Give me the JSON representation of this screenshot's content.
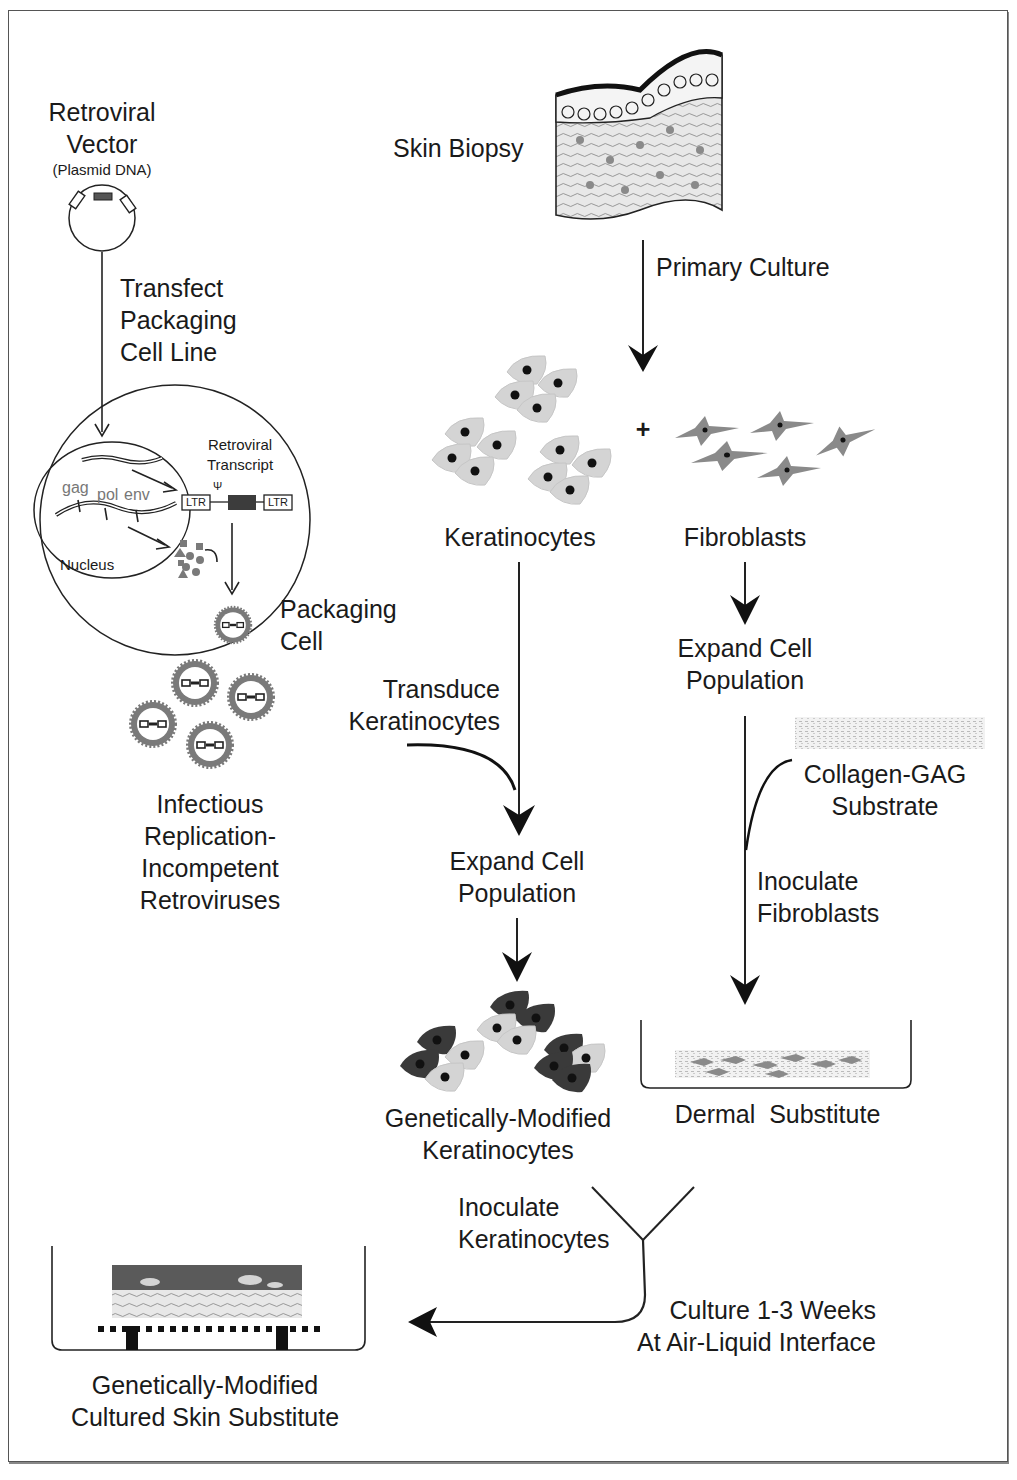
{
  "figure": {
    "left_column": {
      "vector_title": [
        "Retroviral",
        "Vector"
      ],
      "vector_subtitle": "(Plasmid DNA)",
      "transfect_step": [
        "Transfect",
        "Packaging",
        "Cell Line"
      ],
      "retroviral_transcript": [
        "Retroviral",
        "Transcript"
      ],
      "genes": {
        "gag": "gag",
        "pol": "pol",
        "env": "env"
      },
      "ltr_left": "LTR",
      "ltr_right": "LTR",
      "psi": "Ψ",
      "nucleus": "Nucleus",
      "packaging_cell": [
        "Packaging",
        "Cell"
      ],
      "retroviruses": [
        "Infectious",
        "Replication-",
        "Incompetent",
        "Retroviruses"
      ]
    },
    "main_flow": {
      "skin_biopsy": "Skin Biopsy",
      "primary_culture": "Primary Culture",
      "plus": "+",
      "keratinocytes": "Keratinocytes",
      "fibroblasts": "Fibroblasts",
      "expand_fibroblasts": [
        "Expand Cell",
        "Population"
      ],
      "transduce": [
        "Transduce",
        "Keratinocytes"
      ],
      "expand_keratinocytes": [
        "Expand Cell",
        "Population"
      ],
      "collagen": [
        "Collagen-GAG",
        "Substrate"
      ],
      "inoculate_fibroblasts": [
        "Inoculate",
        "Fibroblasts"
      ],
      "gm_keratinocytes": [
        "Genetically-Modified",
        "Keratinocytes"
      ],
      "dermal_substitute": "Dermal  Substitute",
      "inoculate_keratinocytes": [
        "Inoculate",
        "Keratinocytes"
      ],
      "culture": [
        "Culture 1-3 Weeks",
        "At Air-Liquid Interface"
      ],
      "final_product": [
        "Genetically-Modified",
        "Cultured Skin Substitute"
      ]
    },
    "colors": {
      "stroke": "#1a1a1a",
      "cell_light": "#d4d4d4",
      "cell_dark": "#3a3a3a",
      "fibroblast": "#8a8a8a",
      "virus_ring": "#7a7a7a"
    }
  }
}
